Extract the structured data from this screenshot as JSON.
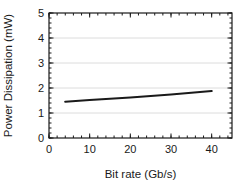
{
  "chart_data": {
    "type": "line",
    "title": "",
    "xlabel": "Bit rate (Gb/s)",
    "ylabel": "Power Dissipation (mW)",
    "xlim": [
      0,
      45
    ],
    "ylim": [
      0,
      5
    ],
    "x_ticks": [
      0,
      10,
      20,
      30,
      40
    ],
    "y_ticks": [
      0,
      1,
      2,
      3,
      4,
      5
    ],
    "x_minor_step": 2,
    "y_minor_step": 0.2,
    "grid": "horizontal-only",
    "grid_y": [
      1,
      2,
      3,
      4
    ],
    "legend": "none",
    "series": [
      {
        "name": "power-dissipation",
        "x": [
          4,
          10,
          20,
          30,
          40
        ],
        "y": [
          1.45,
          1.52,
          1.62,
          1.74,
          1.88
        ]
      }
    ],
    "colors": {
      "line": "#1a1a1a",
      "axis": "#1a1a1a",
      "grid": "#dcdcdc",
      "text": "#1a1a1a",
      "background": "#ffffff"
    }
  }
}
